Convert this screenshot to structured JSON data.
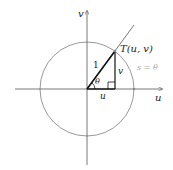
{
  "diagram": {
    "axes": {
      "horizontal_label": "u",
      "vertical_label": "v"
    },
    "point_label": "T(u, v)",
    "hypotenuse_label": "1",
    "opposite_label": "v",
    "adjacent_label": "u",
    "angle_label": "θ",
    "arc_label": "s = θ",
    "colors": {
      "axis": "#555555",
      "circle": "#999999",
      "triangle": "#111111",
      "arc_label": "#aaaaaa",
      "text": "#222222"
    }
  }
}
